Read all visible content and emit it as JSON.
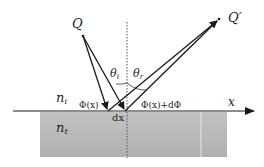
{
  "diagram": {
    "labels": {
      "source_point": "Q",
      "image_point": "Q′",
      "incident_angle": "θ",
      "incident_angle_sub": "i",
      "reflected_angle": "θ",
      "reflected_angle_sub": "r",
      "medium_incident": "n",
      "medium_incident_sub": "i",
      "medium_transmitted": "n",
      "medium_transmitted_sub": "t",
      "phase_left": "Φ(x)",
      "phase_right": "Φ(x)+dΦ",
      "element_width": "dx",
      "axis": "x"
    },
    "colors": {
      "rays": "#1a1a1a",
      "normal": "#555555",
      "lower_medium": "#b8b8b8",
      "background": "#ffffff"
    },
    "elements": [
      {
        "type": "point",
        "name": "Q",
        "x": 83,
        "y": 36
      },
      {
        "type": "point",
        "name": "Q′",
        "x": 219,
        "y": 19
      },
      {
        "type": "ray",
        "name": "incident-ray-1",
        "from": [
          83,
          36
        ],
        "to": [
          108,
          111
        ]
      },
      {
        "type": "ray",
        "name": "incident-ray-2",
        "from": [
          83,
          36
        ],
        "to": [
          125,
          111
        ]
      },
      {
        "type": "ray",
        "name": "reflected-ray-1",
        "from": [
          112,
          111
        ],
        "to": [
          219,
          19
        ]
      },
      {
        "type": "ray",
        "name": "reflected-ray-2",
        "from": [
          128,
          111
        ],
        "to": [
          219,
          19
        ]
      },
      {
        "type": "normal",
        "name": "surface-normal",
        "x": 127,
        "y1": 22,
        "y2": 158,
        "style": "dotted"
      },
      {
        "type": "axis",
        "name": "x-axis",
        "y": 111,
        "x1": 13,
        "x2": 254
      },
      {
        "type": "region",
        "name": "lower-medium",
        "x": 40,
        "y": 112,
        "w": 187,
        "h": 45
      }
    ]
  }
}
